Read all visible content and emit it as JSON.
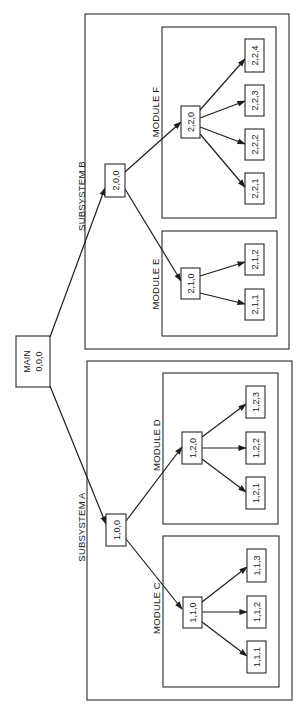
{
  "diagram": {
    "orientation": "rotated -90deg",
    "root": {
      "id": "main",
      "title": "MAIN",
      "code": "0,0,0"
    },
    "subsystems": [
      {
        "id": "sub-a",
        "label": "SUBSYSTEM A",
        "node": "1,0,0",
        "modules": [
          {
            "id": "mod-c",
            "label": "MODULE C",
            "node": "1,1,0",
            "leaves": [
              "1,1,1",
              "1,1,2",
              "1,1,3"
            ]
          },
          {
            "id": "mod-d",
            "label": "MODULE D",
            "node": "1,2,0",
            "leaves": [
              "1,2,1",
              "1,2,2",
              "1,2,3"
            ]
          }
        ]
      },
      {
        "id": "sub-b",
        "label": "SUBSYSTEM B",
        "node": "2,0,0",
        "modules": [
          {
            "id": "mod-e",
            "label": "MODULE E",
            "node": "2,1,0",
            "leaves": [
              "2,1,1",
              "2,1,2"
            ]
          },
          {
            "id": "mod-f",
            "label": "MODULE F",
            "node": "2,2,0",
            "leaves": [
              "2,2,1",
              "2,2,2",
              "2,2,3",
              "2,2,4"
            ]
          }
        ]
      }
    ]
  }
}
